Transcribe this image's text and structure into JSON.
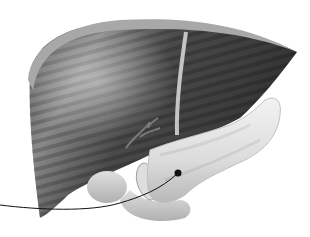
{
  "illustration": {
    "subject": "Anatomical illustration of liver, gallbladder, duodenum and pancreas",
    "style": "grayscale",
    "colors": {
      "background": "#ffffff",
      "liver_dark": "#3a3a3a",
      "liver_mid": "#6e6e6e",
      "liver_rim": "#a8a8a8",
      "ligament": "#bdbdbd",
      "pancreas": "#e6e6e6",
      "pancreas_shadow": "#b5b5b5",
      "duodenum": "#d2d2d2",
      "leader_line": "#111111"
    },
    "pointer": {
      "target": "pancreas",
      "dot": {
        "x": 178,
        "y": 173
      }
    }
  }
}
